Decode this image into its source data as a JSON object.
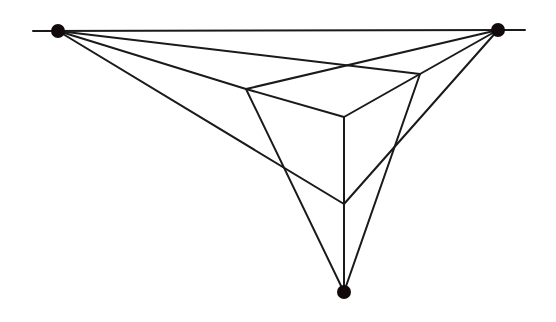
{
  "diagram": {
    "title": "",
    "type": "three-point perspective box",
    "stroke_color": "#1a1a1a",
    "point_color": "#120a0a",
    "horizon": {
      "x1": 33,
      "y1": 31,
      "x2": 525,
      "y2": 30
    },
    "vanishing_points": [
      {
        "name": "vp-left",
        "x": 58,
        "y": 31,
        "r": 7
      },
      {
        "name": "vp-right",
        "x": 498,
        "y": 30,
        "r": 7
      },
      {
        "name": "vp-bottom",
        "x": 344,
        "y": 292,
        "r": 7
      }
    ],
    "box": {
      "top_left": [
        246,
        89
      ],
      "top_back": [
        347,
        65
      ],
      "top_right": [
        420,
        74
      ],
      "front": [
        344,
        117
      ],
      "bottom": [
        344,
        204
      ]
    }
  }
}
